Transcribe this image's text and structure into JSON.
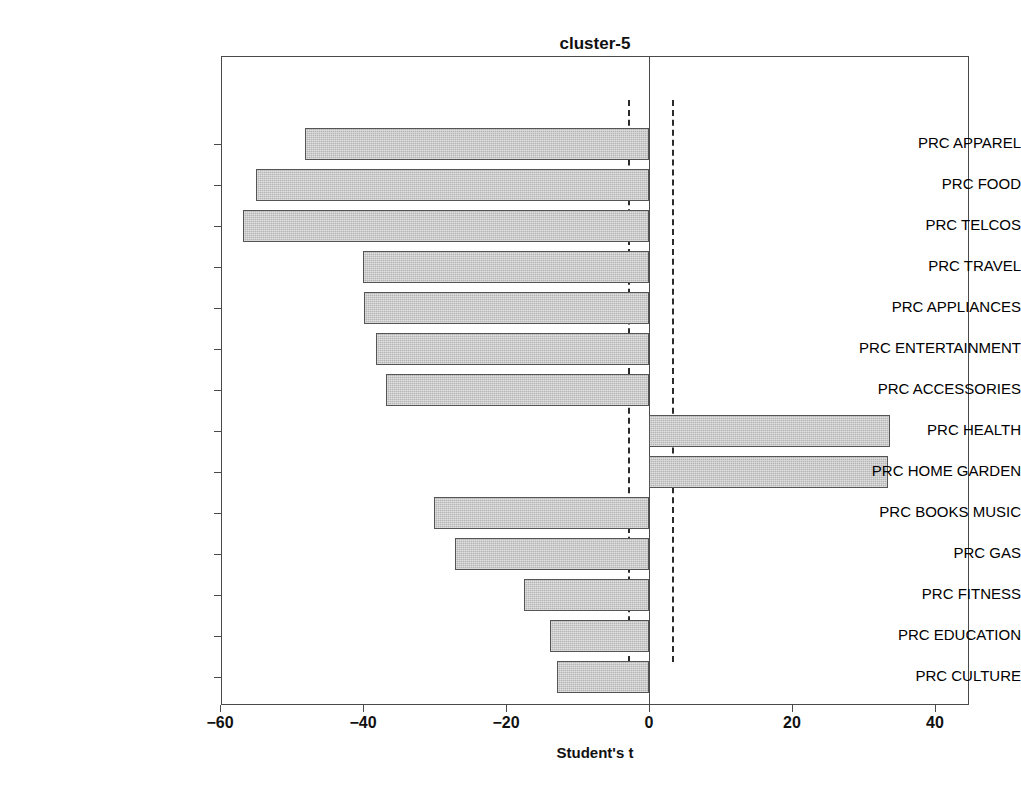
{
  "chart_data": {
    "type": "bar",
    "orientation": "horizontal",
    "title": "cluster-5",
    "xlabel": "Student's t",
    "ylabel": "",
    "xlim": [
      -62.5,
      44.9
    ],
    "xticks": [
      -60,
      -40,
      -20,
      0,
      20,
      40
    ],
    "xtick_labels": [
      "−60",
      "−40",
      "−20",
      "0",
      "20",
      "40"
    ],
    "grid": false,
    "legend": null,
    "reference_lines": [
      -3.0,
      3.2
    ],
    "reference_line_style": "dashed",
    "zero_line": 0,
    "categories": [
      "PRC APPAREL",
      "PRC FOOD",
      "PRC TELCOS",
      "PRC TRAVEL",
      "PRC APPLIANCES",
      "PRC ENTERTAINMENT",
      "PRC ACCESSORIES",
      "PRC HEALTH",
      "PRC HOME GARDEN",
      "PRC BOOKS MUSIC",
      "PRC GAS",
      "PRC FITNESS",
      "PRC EDUCATION",
      "PRC CULTURE"
    ],
    "values": [
      -48.1,
      -55.0,
      -56.8,
      -40.0,
      -39.9,
      -38.2,
      -36.8,
      33.7,
      33.4,
      -30.1,
      -27.1,
      -17.5,
      -13.8,
      -12.9
    ],
    "bar_color": "#b5b5b5",
    "bar_edge_color": "#555555"
  }
}
